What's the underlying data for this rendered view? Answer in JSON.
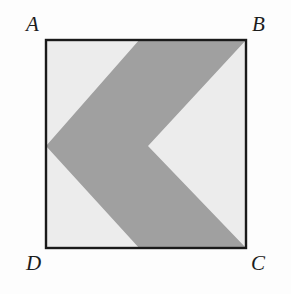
{
  "figure": {
    "labels": {
      "a": "A",
      "b": "B",
      "c": "C",
      "d": "D"
    },
    "colors": {
      "background": "#fdfdfd",
      "square_fill": "#ececec",
      "square_border": "#1a1a1a",
      "shaded_region": "#a0a0a0"
    },
    "geometry": {
      "square": {
        "top_left": [
          45,
          39
        ],
        "top_right": [
          247,
          39
        ],
        "bottom_right": [
          247,
          249
        ],
        "bottom_left": [
          45,
          249
        ],
        "width": 202,
        "height": 210,
        "border_width": 2
      },
      "chevron": {
        "outer_vertex": [
          46,
          146
        ],
        "inner_vertex": [
          148,
          146
        ],
        "top_edge_start": [
          140,
          39
        ],
        "bottom_edge_start": [
          140,
          249
        ],
        "points": "247,39 140,39 46,146 140,249 247,249 148,146"
      }
    }
  }
}
